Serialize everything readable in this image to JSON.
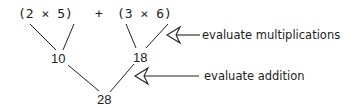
{
  "expression": {
    "left_group": "(2  ×  5)",
    "operator": "+",
    "right_group": "(3  ×  6)"
  },
  "nodes": {
    "left_product": "10",
    "right_product": "18",
    "sum": "28"
  },
  "annotations": {
    "multiplication_label": "evaluate multiplications",
    "addition_label": "evaluate addition"
  },
  "colors": {
    "ink": "#222222",
    "background": "#ffffff"
  }
}
